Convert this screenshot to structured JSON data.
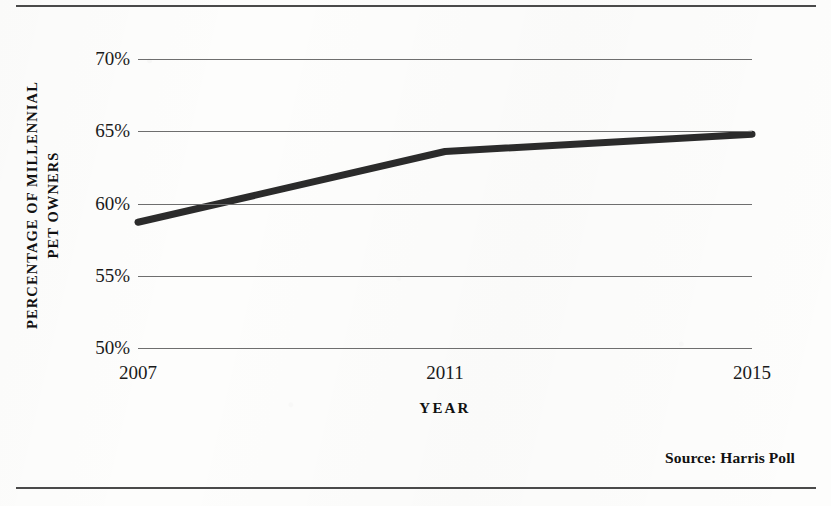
{
  "figure": {
    "source_note": "Source: Harris Poll"
  },
  "chart_data": {
    "type": "line",
    "title": "",
    "xlabel": "YEAR",
    "ylabel_line1": "PERCENTAGE OF MILLENNIAL",
    "ylabel_line2": "PET OWNERS",
    "x": [
      2007,
      2011,
      2015
    ],
    "categories": [
      "2007",
      "2011",
      "2015"
    ],
    "values": [
      58.7,
      63.6,
      64.8
    ],
    "series": [
      {
        "name": "Percentage of millennial pet owners",
        "values": [
          58.7,
          63.6,
          64.8
        ],
        "color": "#2b2b2b"
      }
    ],
    "ylim": [
      50,
      70
    ],
    "yticks": [
      70,
      65,
      60,
      55,
      50
    ],
    "ytick_labels": [
      "70%",
      "65%",
      "60%",
      "55%",
      "50%"
    ],
    "xticks": [
      2007,
      2011,
      2015
    ],
    "xtick_labels": [
      "2007",
      "2011",
      "2015"
    ],
    "xlim": [
      2007,
      2015
    ],
    "grid": "horizontal",
    "legend": "none",
    "line_width_px": 7,
    "gridline_color": "#6e6e6e",
    "rule_color": "#4a4a4a"
  }
}
